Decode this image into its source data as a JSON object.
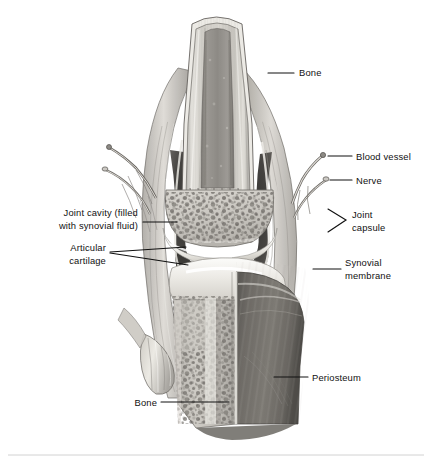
{
  "figure": {
    "type": "anatomical-illustration",
    "style": "grayscale pencil/airbrush medical illustration",
    "background_color": "#ffffff",
    "width": 432,
    "height": 464
  },
  "labels": [
    {
      "id": "bone-top",
      "text": "Bone",
      "side": "right",
      "text_x": 299,
      "text_y": 76,
      "anchor": "start",
      "leader": "M 268 73 L 294 73",
      "lines": [
        "Bone"
      ]
    },
    {
      "id": "blood-vessel",
      "text": "Blood vessel",
      "side": "right",
      "text_x": 356,
      "text_y": 160,
      "anchor": "start",
      "leader": "M 328 156 L 352 156",
      "lines": [
        "Blood vessel"
      ]
    },
    {
      "id": "nerve",
      "text": "Nerve",
      "side": "right",
      "text_x": 356,
      "text_y": 184,
      "anchor": "start",
      "leader": "M 330 180 L 352 180",
      "lines": [
        "Nerve"
      ]
    },
    {
      "id": "joint-capsule",
      "text": "Joint capsule",
      "side": "right",
      "text_x": 352,
      "text_y": 221,
      "anchor": "start",
      "leader": "M 328 209 L 346 220 L 328 232",
      "lines": [
        "Joint",
        "capsule"
      ]
    },
    {
      "id": "synovial-membrane",
      "text": "Synovial membrane",
      "side": "right",
      "text_x": 345,
      "text_y": 262,
      "anchor": "start",
      "leader": "M 313 269 L 341 269",
      "lines": [
        "Synovial",
        "membrane"
      ]
    },
    {
      "id": "periosteum",
      "text": "Periosteum",
      "side": "right",
      "text_x": 312,
      "text_y": 381,
      "anchor": "start",
      "leader": "M 274 377 L 308 377",
      "lines": [
        "Periosteum"
      ]
    },
    {
      "id": "joint-cavity",
      "text": "Joint cavity (filled with synovial fluid)",
      "side": "left",
      "text_x": 138,
      "text_y": 215,
      "anchor": "end",
      "leader": "M 143 222 L 177 222",
      "lines": [
        "Joint cavity (filled",
        "with synovial fluid)"
      ]
    },
    {
      "id": "articular-cartilage",
      "text": "Articular cartilage",
      "side": "left",
      "text_x": 126,
      "text_y": 251,
      "anchor": "end",
      "leader": "M 110 252 L 186 247 M 110 253 L 188 265",
      "lines": [
        "Articular",
        "cartilage"
      ]
    },
    {
      "id": "bone-bottom",
      "text": "Bone",
      "side": "left",
      "text_x": 155,
      "text_y": 406,
      "anchor": "end",
      "leader": "M 161 402 L 229 402",
      "lines": [
        "Bone"
      ]
    }
  ],
  "structures": [
    {
      "name": "femur-shaft",
      "description": "compact cortical bone of the femur shaft, light gray with vertical striations"
    },
    {
      "name": "medullary-cavity",
      "description": "darker central marrow column within the femur shaft"
    },
    {
      "name": "femoral-condyle-spongy-bone",
      "description": "speckled trabecular / spongy bone of the femoral condyle"
    },
    {
      "name": "femoral-articular-cartilage",
      "description": "smooth white cartilage cap over the femoral condyle"
    },
    {
      "name": "tibial-articular-cartilage",
      "description": "smooth white cartilage on the tibial plateau"
    },
    {
      "name": "joint-cavity-space",
      "description": "dark recess containing synovial fluid"
    },
    {
      "name": "joint-capsule-wall",
      "description": "fibrous outer sleeve enclosing the joint on both sides"
    },
    {
      "name": "synovial-membrane-lining",
      "description": "thin pale lining inside the capsule"
    },
    {
      "name": "tibia-spongy-bone",
      "description": "cut face of tibial trabecular bone"
    },
    {
      "name": "tibia-periosteum",
      "description": "dark gray intact outer surface of the tibia"
    },
    {
      "name": "patellar-ligament-stump",
      "description": "cut cylindrical ligament stump anterior to the tibia"
    },
    {
      "name": "blood-vessel-branches",
      "description": "vessels entering the capsule on both sides"
    },
    {
      "name": "nerve-branches",
      "description": "nerve fibers running alongside vessels"
    }
  ],
  "footer_rule": {
    "present": true,
    "y": 455,
    "x1": 8,
    "x2": 424,
    "color": "#d2d2d2"
  }
}
